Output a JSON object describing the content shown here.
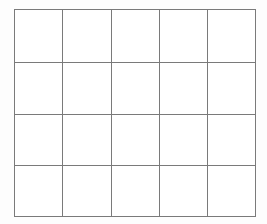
{
  "figure": {
    "kind": "blank-grid-table",
    "background_color": "#fdfdfd",
    "canvas_color": "#ffffff"
  },
  "grid": {
    "columns": 5,
    "rows": 4,
    "total_cells": 20,
    "line_color": "#7a7a7a",
    "line_width_px": 1,
    "cell_fill": "#ffffff",
    "bounds": {
      "left_px": 14,
      "top_px": 9,
      "right_px": 255,
      "bottom_px": 216,
      "width_px": 241,
      "height_px": 207
    },
    "column_edges_px": [
      14,
      62,
      111,
      159,
      207,
      255
    ],
    "row_edges_px": [
      9,
      62,
      114,
      165,
      216
    ],
    "column_widths_px": [
      48,
      49,
      48,
      48,
      48
    ],
    "row_heights_px": [
      53,
      52,
      51,
      51
    ],
    "column_headers": [
      "",
      "",
      "",
      "",
      ""
    ],
    "row_headers": [
      "",
      "",
      "",
      ""
    ],
    "cells": [
      [
        "",
        "",
        "",
        "",
        ""
      ],
      [
        "",
        "",
        "",
        "",
        ""
      ],
      [
        "",
        "",
        "",
        "",
        ""
      ],
      [
        "",
        "",
        "",
        "",
        ""
      ]
    ]
  }
}
